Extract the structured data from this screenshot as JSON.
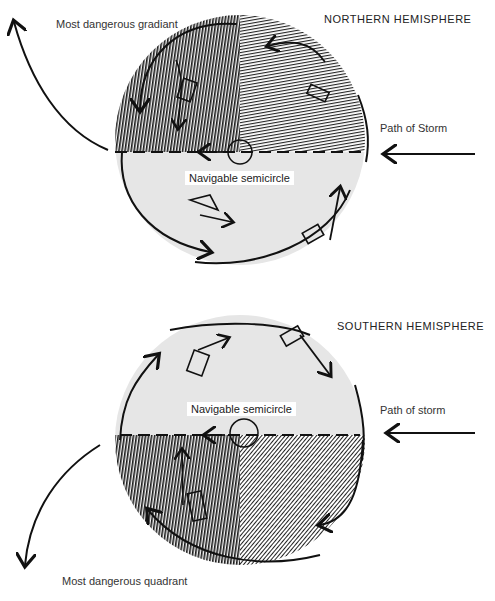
{
  "northern": {
    "title": "NORTHERN HEMISPHERE",
    "danger_label": "Most dangerous gradiant",
    "path_label": "Path of Storm",
    "navigable_label": "Navigable semicircle"
  },
  "southern": {
    "title": "SOUTHERN HEMISPHERE",
    "danger_label": "Most dangerous quadrant",
    "path_label": "Path of storm",
    "navigable_label": "Navigable semicircle"
  },
  "colors": {
    "navigable_fill": "#e6e6e6",
    "dark_hatch": "#1a1a1a",
    "line": "#111111"
  }
}
